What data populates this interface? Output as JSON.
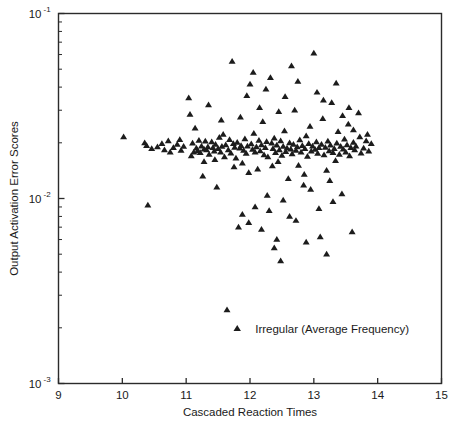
{
  "chart_data": {
    "type": "scatter",
    "title": "",
    "xlabel": "Cascaded Reaction Times",
    "ylabel": "Output Activation Error Scores",
    "xlim": [
      9,
      15
    ],
    "ylim": [
      0.001,
      0.1
    ],
    "yscale": "log",
    "xscale": "linear",
    "grid": false,
    "xticks": [
      9,
      10,
      11,
      12,
      13,
      14,
      15
    ],
    "xticklabels": [
      "9",
      "10",
      "11",
      "12",
      "13",
      "14",
      "15"
    ],
    "yticks": [
      0.001,
      0.01,
      0.1
    ],
    "yticklabels": [
      "10-3",
      "10-2",
      "10-1"
    ],
    "ytick_base": "10",
    "ytick_exponents": [
      "-1",
      "-2",
      "-3"
    ],
    "legend": {
      "position": "inside-lower-center",
      "entries": [
        {
          "label": "Irregular (Average Frequency)",
          "marker": "triangle",
          "color": "#1c1c1c"
        }
      ]
    },
    "series": [
      {
        "name": "Irregular (Average Frequency)",
        "marker": "triangle",
        "color": "#1c1c1c",
        "n_points": 191,
        "points": [
          [
            10.02,
            0.0215
          ],
          [
            10.38,
            0.0193
          ],
          [
            10.4,
            0.0092
          ],
          [
            10.46,
            0.0186
          ],
          [
            10.62,
            0.0198
          ],
          [
            10.66,
            0.0183
          ],
          [
            10.72,
            0.0205
          ],
          [
            10.8,
            0.0188
          ],
          [
            10.86,
            0.0196
          ],
          [
            10.92,
            0.0182
          ],
          [
            10.96,
            0.0191
          ],
          [
            11.04,
            0.035
          ],
          [
            11.06,
            0.0285
          ],
          [
            11.1,
            0.0199
          ],
          [
            11.12,
            0.0178
          ],
          [
            11.14,
            0.024
          ],
          [
            11.16,
            0.0187
          ],
          [
            11.18,
            0.0181
          ],
          [
            11.2,
            0.0206
          ],
          [
            11.22,
            0.0177
          ],
          [
            11.24,
            0.0192
          ],
          [
            11.26,
            0.0132
          ],
          [
            11.28,
            0.0185
          ],
          [
            11.3,
            0.0204
          ],
          [
            11.32,
            0.0183
          ],
          [
            11.34,
            0.019
          ],
          [
            11.36,
            0.0173
          ],
          [
            11.4,
            0.0202
          ],
          [
            11.42,
            0.0188
          ],
          [
            11.44,
            0.018
          ],
          [
            11.46,
            0.0196
          ],
          [
            11.48,
            0.0115
          ],
          [
            11.5,
            0.0186
          ],
          [
            11.52,
            0.0214
          ],
          [
            11.54,
            0.0178
          ],
          [
            11.56,
            0.0191
          ],
          [
            11.58,
            0.0222
          ],
          [
            11.6,
            0.0168
          ],
          [
            11.62,
            0.0195
          ],
          [
            11.64,
            0.0025
          ],
          [
            11.66,
            0.0183
          ],
          [
            11.68,
            0.0208
          ],
          [
            11.7,
            0.0176
          ],
          [
            11.72,
            0.055
          ],
          [
            11.74,
            0.0198
          ],
          [
            11.76,
            0.0189
          ],
          [
            11.78,
            0.0165
          ],
          [
            11.8,
            0.0201
          ],
          [
            11.82,
            0.007
          ],
          [
            11.84,
            0.0187
          ],
          [
            11.86,
            0.0193
          ],
          [
            11.88,
            0.0155
          ],
          [
            11.9,
            0.0182
          ],
          [
            11.92,
            0.021
          ],
          [
            11.94,
            0.0175
          ],
          [
            11.96,
            0.0192
          ],
          [
            11.98,
            0.0138
          ],
          [
            12.0,
            0.0415
          ],
          [
            12.02,
            0.0197
          ],
          [
            12.04,
            0.0184
          ],
          [
            12.06,
            0.0225
          ],
          [
            12.08,
            0.0178
          ],
          [
            12.1,
            0.019
          ],
          [
            12.12,
            0.0144
          ],
          [
            12.14,
            0.0206
          ],
          [
            12.16,
            0.0181
          ],
          [
            12.18,
            0.0195
          ],
          [
            12.2,
            0.026
          ],
          [
            12.22,
            0.0172
          ],
          [
            12.24,
            0.0188
          ],
          [
            12.26,
            0.0203
          ],
          [
            12.28,
            0.0168
          ],
          [
            12.3,
            0.0086
          ],
          [
            12.32,
            0.045
          ],
          [
            12.34,
            0.0199
          ],
          [
            12.36,
            0.0186
          ],
          [
            12.38,
            0.0212
          ],
          [
            12.4,
            0.0177
          ],
          [
            12.42,
            0.0194
          ],
          [
            12.44,
            0.0158
          ],
          [
            12.46,
            0.0183
          ],
          [
            12.48,
            0.0205
          ],
          [
            12.5,
            0.0171
          ],
          [
            12.52,
            0.0191
          ],
          [
            12.54,
            0.0232
          ],
          [
            12.56,
            0.0179
          ],
          [
            12.58,
            0.0187
          ],
          [
            12.6,
            0.0128
          ],
          [
            12.62,
            0.02
          ],
          [
            12.64,
            0.0185
          ],
          [
            12.66,
            0.0174
          ],
          [
            12.68,
            0.0196
          ],
          [
            12.7,
            0.03
          ],
          [
            12.72,
            0.0182
          ],
          [
            12.74,
            0.019
          ],
          [
            12.76,
            0.0151
          ],
          [
            12.78,
            0.0207
          ],
          [
            12.8,
            0.0178
          ],
          [
            12.82,
            0.0193
          ],
          [
            12.84,
            0.0118
          ],
          [
            12.86,
            0.0186
          ],
          [
            12.88,
            0.0218
          ],
          [
            12.9,
            0.0169
          ],
          [
            12.92,
            0.0198
          ],
          [
            12.94,
            0.0245
          ],
          [
            12.96,
            0.018
          ],
          [
            12.98,
            0.0192
          ],
          [
            13.0,
            0.061
          ],
          [
            13.02,
            0.0184
          ],
          [
            13.04,
            0.0202
          ],
          [
            13.06,
            0.0175
          ],
          [
            13.08,
            0.0188
          ],
          [
            13.1,
            0.0062
          ],
          [
            13.12,
            0.0196
          ],
          [
            13.14,
            0.027
          ],
          [
            13.16,
            0.0172
          ],
          [
            13.18,
            0.0189
          ],
          [
            13.2,
            0.0142
          ],
          [
            13.22,
            0.0204
          ],
          [
            13.24,
            0.0181
          ],
          [
            13.26,
            0.0194
          ],
          [
            13.28,
            0.033
          ],
          [
            13.3,
            0.0177
          ],
          [
            13.32,
            0.0186
          ],
          [
            13.34,
            0.016
          ],
          [
            13.36,
            0.0199
          ],
          [
            13.38,
            0.023
          ],
          [
            13.4,
            0.0173
          ],
          [
            13.42,
            0.0191
          ],
          [
            13.44,
            0.0106
          ],
          [
            13.46,
            0.0185
          ],
          [
            13.48,
            0.0209
          ],
          [
            13.5,
            0.0178
          ],
          [
            13.52,
            0.0195
          ],
          [
            13.54,
            0.0252
          ],
          [
            13.56,
            0.017
          ],
          [
            13.58,
            0.0188
          ],
          [
            13.6,
            0.0066
          ],
          [
            13.62,
            0.0201
          ],
          [
            13.64,
            0.0183
          ],
          [
            13.66,
            0.0192
          ],
          [
            13.7,
            0.029
          ],
          [
            13.74,
            0.0176
          ],
          [
            13.78,
            0.0187
          ],
          [
            13.82,
            0.0205
          ],
          [
            13.86,
            0.018
          ],
          [
            11.35,
            0.032
          ],
          [
            11.55,
            0.0265
          ],
          [
            11.95,
            0.036
          ],
          [
            12.25,
            0.039
          ],
          [
            12.55,
            0.0355
          ],
          [
            12.75,
            0.043
          ],
          [
            13.05,
            0.0375
          ],
          [
            13.35,
            0.042
          ],
          [
            12.05,
            0.048
          ],
          [
            12.65,
            0.052
          ],
          [
            12.45,
            0.0295
          ],
          [
            12.15,
            0.031
          ],
          [
            11.85,
            0.0275
          ],
          [
            13.15,
            0.034
          ],
          [
            13.45,
            0.028
          ],
          [
            13.55,
            0.031
          ],
          [
            12.35,
            0.015
          ],
          [
            12.85,
            0.0135
          ],
          [
            11.75,
            0.0148
          ],
          [
            13.25,
            0.0125
          ],
          [
            12.95,
            0.0112
          ],
          [
            12.27,
            0.0104
          ],
          [
            11.45,
            0.0162
          ],
          [
            12.52,
            0.0098
          ],
          [
            13.62,
            0.0235
          ],
          [
            13.72,
            0.0215
          ],
          [
            13.84,
            0.0222
          ],
          [
            13.9,
            0.0198
          ],
          [
            10.35,
            0.02
          ],
          [
            10.55,
            0.019
          ],
          [
            10.75,
            0.0178
          ],
          [
            10.9,
            0.0208
          ],
          [
            11.08,
            0.017
          ],
          [
            11.28,
            0.0158
          ],
          [
            12.62,
            0.008
          ],
          [
            12.72,
            0.0076
          ],
          [
            13.08,
            0.0088
          ],
          [
            11.98,
            0.0074
          ],
          [
            12.18,
            0.0068
          ],
          [
            12.42,
            0.006
          ],
          [
            12.38,
            0.0054
          ],
          [
            12.88,
            0.0058
          ],
          [
            11.88,
            0.0082
          ],
          [
            12.08,
            0.009
          ],
          [
            13.3,
            0.0096
          ],
          [
            12.48,
            0.0046
          ],
          [
            13.2,
            0.005
          ]
        ]
      }
    ]
  },
  "legend": {
    "label": "Irregular (Average Frequency)"
  },
  "axes": {
    "x_title": "Cascaded Reaction Times",
    "y_title": "Output Activation Error Scores"
  }
}
